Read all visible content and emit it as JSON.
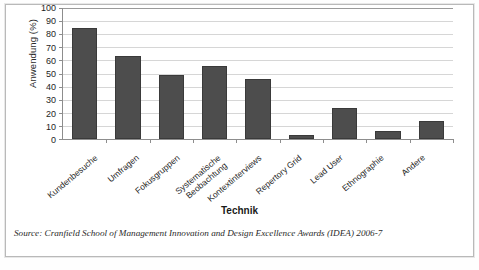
{
  "chart_data": {
    "type": "bar",
    "title": "",
    "xlabel": "Technik",
    "ylabel": "Anwendung (%)",
    "ylim": [
      0,
      100
    ],
    "ytick_step": 10,
    "yticks": [
      100,
      90,
      80,
      70,
      60,
      50,
      40,
      30,
      20,
      10,
      0
    ],
    "grid": true,
    "legend": "none",
    "bar_color": "#4d4d4d",
    "categories": [
      "Kundenbesuche",
      "Umfragen",
      "Fokusgruppen",
      "Systematische Beobachtung",
      "Kontextinterviews",
      "Repertory Grid",
      "Lead User",
      "Ethnographie",
      "Andere"
    ],
    "category_lines": [
      [
        "Kundenbesuche",
        ""
      ],
      [
        "Umfragen",
        ""
      ],
      [
        "Fokusgruppen",
        ""
      ],
      [
        "Systematische",
        "Beobachtung"
      ],
      [
        "Kontextinterviews",
        ""
      ],
      [
        "Repertory Grid",
        ""
      ],
      [
        "Lead User",
        ""
      ],
      [
        "Ethnographie",
        ""
      ],
      [
        "Andere",
        ""
      ]
    ],
    "values": [
      85,
      63,
      49,
      56,
      46,
      3,
      24,
      6,
      14
    ]
  },
  "caption": {
    "source": "Source: Cranfield School of Management Innovation and Design Excellence Awards (IDEA) 2006-7"
  }
}
